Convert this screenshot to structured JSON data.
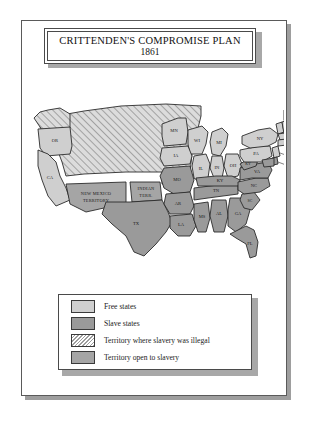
{
  "title": {
    "line1": "CRITTENDEN'S COMPROMISE  PLAN",
    "line2": "1861"
  },
  "legend": {
    "items": [
      {
        "label": "Free states",
        "swatch": "free",
        "color": "#cfcfcf"
      },
      {
        "label": "Slave states",
        "swatch": "slave",
        "color": "#9a9a9a"
      },
      {
        "label": "Territory where slavery was illegal",
        "swatch": "hatched",
        "color": "#d6d6d6"
      },
      {
        "label": "Territory open to slavery",
        "swatch": "open",
        "color": "#a5a5a5"
      }
    ]
  },
  "map": {
    "free_states": [
      "OR",
      "CA",
      "MN",
      "WI",
      "IA",
      "IL",
      "IN",
      "OH",
      "MI",
      "NY",
      "PA",
      "ME",
      "NH",
      "VT",
      "MA",
      "CT",
      "RI",
      "NJ"
    ],
    "slave_states": [
      "MO",
      "AR",
      "TX",
      "LA",
      "MS",
      "AL",
      "GA",
      "FL",
      "SC",
      "NC",
      "VA",
      "KY",
      "TN",
      "DE",
      "MD"
    ],
    "territory_slavery_illegal": [
      "Washington Territory",
      "Nebraska Territory",
      "Dakota Territory",
      "Utah Territory",
      "Kansas"
    ],
    "territory_open_to_slavery": [
      "NEW MEXICO TERRITORY",
      "INDIAN TERR."
    ],
    "labels": {
      "or": "OR",
      "ca": "CA",
      "mn": "MN",
      "wi": "WI",
      "ia": "IA",
      "mi": "MI",
      "il": "IL",
      "in": "IN",
      "oh": "OH",
      "mo": "MO",
      "ar": "AR",
      "tx": "TX",
      "la": "LA",
      "ms": "MS",
      "al": "AL",
      "ga": "GA",
      "fl": "FL",
      "sc": "SC",
      "nc": "NC",
      "va": "VA",
      "ky": "KY",
      "tn": "TN",
      "ny": "NY",
      "pa": "PA",
      "me": "ME",
      "nj": "NJ",
      "de": "DE",
      "ri": "RI",
      "md": "MD",
      "new_mexico": "NEW MEXICO",
      "territory": "TERRITORY",
      "indian": "INDIAN",
      "terr": "TERR."
    }
  }
}
